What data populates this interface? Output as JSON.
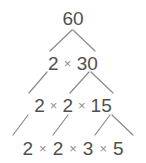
{
  "diagram": {
    "root": "60",
    "operator": "×",
    "colors": {
      "text": "#4f4f4f",
      "operator": "#8e8e8e",
      "edge": "#8a8a8a",
      "background": "#ffffff"
    },
    "rows": [
      {
        "level": 1,
        "terms": [
          "60"
        ]
      },
      {
        "level": 2,
        "terms": [
          "2",
          "30"
        ]
      },
      {
        "level": 3,
        "terms": [
          "2",
          "2",
          "15"
        ]
      },
      {
        "level": 4,
        "terms": [
          "2",
          "2",
          "3",
          "5"
        ]
      }
    ],
    "edges": [
      {
        "from": "60",
        "to": "2",
        "x1": 72,
        "y1": 30,
        "x2": 50,
        "y2": 51
      },
      {
        "from": "60",
        "to": "30",
        "x1": 73,
        "y1": 30,
        "x2": 95,
        "y2": 51
      },
      {
        "from": "2",
        "to": "2",
        "x1": 47,
        "y1": 72,
        "x2": 29,
        "y2": 93
      },
      {
        "from": "30",
        "to": "2",
        "x1": 89,
        "y1": 72,
        "x2": 70,
        "y2": 93
      },
      {
        "from": "30",
        "to": "15",
        "x1": 91,
        "y1": 72,
        "x2": 113,
        "y2": 93
      },
      {
        "from": "2",
        "to": "2",
        "x1": 28,
        "y1": 115,
        "x2": 13,
        "y2": 135
      },
      {
        "from": "2",
        "to": "2",
        "x1": 68,
        "y1": 115,
        "x2": 53,
        "y2": 135
      },
      {
        "from": "15",
        "to": "3",
        "x1": 110,
        "y1": 115,
        "x2": 95,
        "y2": 135
      },
      {
        "from": "15",
        "to": "5",
        "x1": 112,
        "y1": 115,
        "x2": 133,
        "y2": 135
      }
    ]
  }
}
